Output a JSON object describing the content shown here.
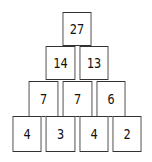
{
  "pyramid": {
    "rows": [
      [
        "27"
      ],
      [
        "14",
        "13"
      ],
      [
        "7",
        "7",
        "6"
      ],
      [
        "4",
        "3",
        "4",
        "2"
      ]
    ]
  }
}
